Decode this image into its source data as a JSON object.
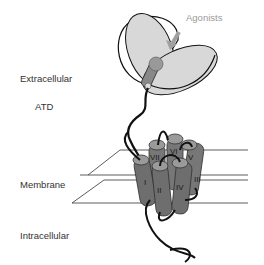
{
  "diagram": {
    "labels": {
      "extracellular": "Extracellular",
      "atd": "ATD",
      "membrane": "Membrane",
      "intracellular": "Intracellular",
      "agonists": "Agonists"
    },
    "helices": [
      "I",
      "II",
      "III",
      "IV",
      "V",
      "VI",
      "VII"
    ],
    "colors": {
      "lobe_fill": "#d8d8d8",
      "helix_fill": "#7a7a7a",
      "helix_top": "#9a9a9a",
      "arrow": "#a0a0a0",
      "outline": "#111111"
    }
  }
}
